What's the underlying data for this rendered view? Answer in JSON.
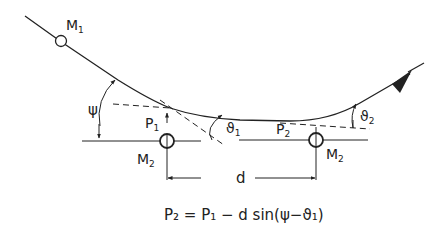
{
  "diagram": {
    "labels": {
      "m1": "M",
      "m1_sub": "1",
      "m2_left": "M",
      "m2_left_sub": "2",
      "m2_right": "M",
      "m2_right_sub": "2",
      "p1": "P",
      "p1_sub": "1",
      "p2": "P",
      "p2_sub": "2",
      "psi": "ψ",
      "theta1": "ϑ",
      "theta1_sub": "1",
      "theta2": "ϑ",
      "theta2_sub": "2",
      "d": "d"
    },
    "formula": "P₂ = P₁ − d sin(ψ−ϑ₁)",
    "colors": {
      "stroke": "#222222",
      "background": "#ffffff"
    }
  }
}
